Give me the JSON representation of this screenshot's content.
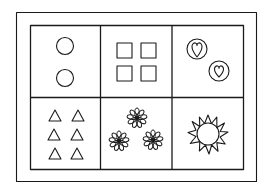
{
  "figure": {
    "stroke_color": "#1a1a1a",
    "background": "#ffffff",
    "cells": [
      {
        "row": 0,
        "col": 0,
        "content": "circles",
        "count": 2
      },
      {
        "row": 0,
        "col": 1,
        "content": "squares",
        "count": 4
      },
      {
        "row": 0,
        "col": 2,
        "content": "hearts-in-circles",
        "count": 2
      },
      {
        "row": 1,
        "col": 0,
        "content": "triangles",
        "count": 6
      },
      {
        "row": 1,
        "col": 1,
        "content": "flowers",
        "count": 3
      },
      {
        "row": 1,
        "col": 2,
        "content": "sun",
        "count": 1
      }
    ]
  }
}
